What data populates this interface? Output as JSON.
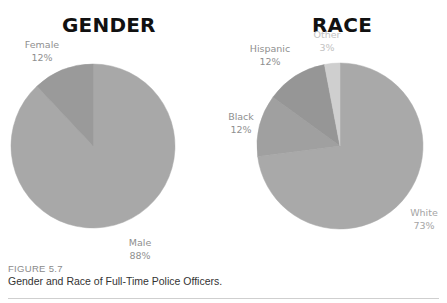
{
  "chart_data": [
    {
      "type": "pie",
      "title": "GENDER",
      "categories": [
        "Male",
        "Female"
      ],
      "values": [
        88,
        12
      ],
      "labels": [
        "Male 88%",
        "Female 12%"
      ],
      "colors": [
        "#a8a8a8",
        "#9a9a9a"
      ]
    },
    {
      "type": "pie",
      "title": "RACE",
      "categories": [
        "White",
        "Black",
        "Hispanic",
        "Other"
      ],
      "values": [
        73,
        12,
        12,
        3
      ],
      "labels": [
        "White 73%",
        "Black 12%",
        "Hispanic 12%",
        "Other 3%"
      ],
      "colors": [
        "#a9a9a9",
        "#a0a0a0",
        "#969696",
        "#cfcfcf"
      ]
    }
  ],
  "gender": {
    "title": "GENDER",
    "male_label": "Male",
    "male_pct": "88%",
    "female_label": "Female",
    "female_pct": "12%"
  },
  "race": {
    "title": "RACE",
    "white_label": "White",
    "white_pct": "73%",
    "black_label": "Black",
    "black_pct": "12%",
    "hispanic_label": "Hispanic",
    "hispanic_pct": "12%",
    "other_label": "Other",
    "other_pct": "3%"
  },
  "figure": {
    "number": "FIGURE 5.7",
    "caption": "Gender and Race of Full-Time Police Officers."
  }
}
